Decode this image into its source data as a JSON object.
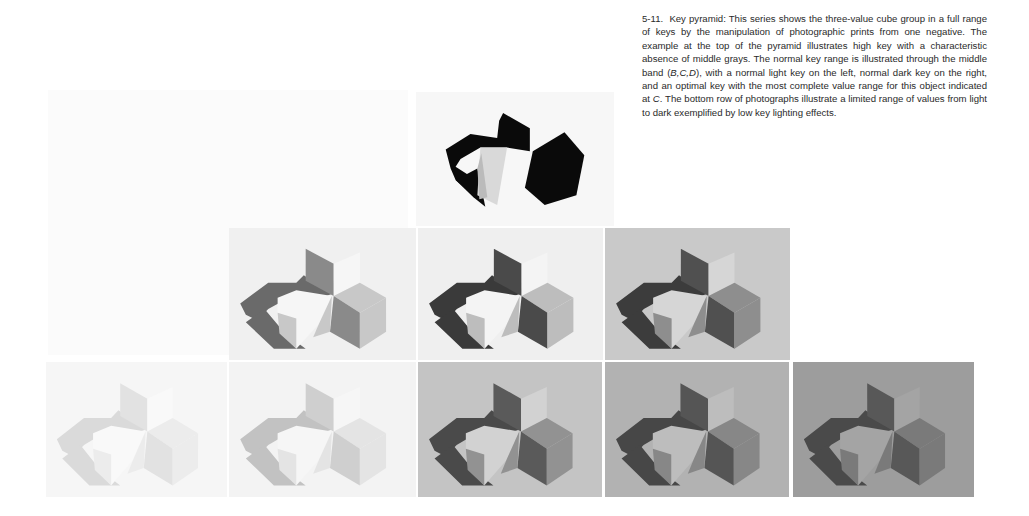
{
  "caption": {
    "figure_number": "5-11.",
    "title": "Key pyramid:",
    "text_1": "This series shows the three-value cube group in a full range of keys by the manipulation of photographic prints from one negative. The example at the top of the pyramid illustrates high key with a characteristic absence of middle grays. The normal key range is illustrated through the middle band (",
    "middle_band_labels": "B,C,D",
    "text_2": "), with a normal light key on the left, normal dark key on the right, and an optimal key with the most complete value range for this object indicated at ",
    "optimal_label": "C",
    "text_3": ". The bottom row of photographs illustrate a limited range of values from light to dark exemplified by low key lighting effects."
  },
  "pyramid": {
    "top_row": [
      {
        "label": "high key",
        "bg": "#f7f7f7",
        "shadow": "#0a0a0a",
        "dark": "#0a0a0a",
        "mid": "#0a0a0a",
        "light": "#f2f2f2"
      }
    ],
    "middle_row": [
      {
        "label": "B",
        "bg": "#f0f0f0",
        "shadow": "#6a6a6a",
        "dark": "#8a8a8a",
        "mid": "#c8c8c8",
        "light": "#f6f6f6"
      },
      {
        "label": "C",
        "bg": "#efefef",
        "shadow": "#3a3a3a",
        "dark": "#4a4a4a",
        "mid": "#bdbdbd",
        "light": "#f4f4f4"
      },
      {
        "label": "D",
        "bg": "#c9c9c9",
        "shadow": "#3c3c3c",
        "dark": "#505050",
        "mid": "#8e8e8e",
        "light": "#d6d6d6"
      }
    ],
    "bottom_row": [
      {
        "label": "light low-range 1",
        "bg": "#f6f6f6",
        "shadow": "#dadada",
        "dark": "#e2e2e2",
        "mid": "#ececec",
        "light": "#f9f9f9"
      },
      {
        "label": "light low-range 2",
        "bg": "#f3f3f3",
        "shadow": "#c2c2c2",
        "dark": "#cfcfcf",
        "mid": "#e4e4e4",
        "light": "#f6f6f6"
      },
      {
        "label": "mid low-range 3",
        "bg": "#c4c4c4",
        "shadow": "#4a4a4a",
        "dark": "#5a5a5a",
        "mid": "#929292",
        "light": "#d2d2d2"
      },
      {
        "label": "dark low-range 4",
        "bg": "#b2b2b2",
        "shadow": "#474747",
        "dark": "#555555",
        "mid": "#878787",
        "light": "#bdbdbd"
      },
      {
        "label": "dark low-range 5",
        "bg": "#9d9d9d",
        "shadow": "#4a4a4a",
        "dark": "#585858",
        "mid": "#7a7a7a",
        "light": "#a4a4a4"
      }
    ]
  }
}
